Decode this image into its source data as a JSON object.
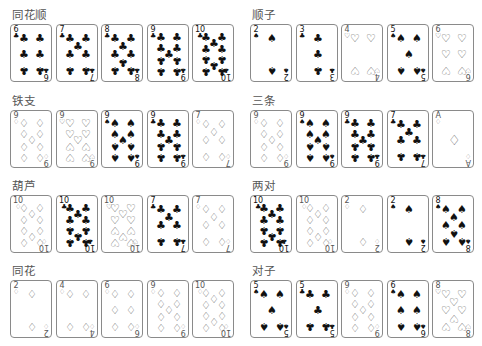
{
  "suit_glyphs": {
    "C": "♣",
    "S": "♠",
    "H": "♡",
    "D": "♢"
  },
  "colors": {
    "border": "#8a8a8a",
    "title": "#555555",
    "black_suit": "#111111",
    "outline_suit": "#555555"
  },
  "groups": [
    {
      "title": "同花顺",
      "cards": [
        {
          "rank": "6",
          "suit": "C"
        },
        {
          "rank": "7",
          "suit": "C"
        },
        {
          "rank": "8",
          "suit": "C"
        },
        {
          "rank": "9",
          "suit": "C"
        },
        {
          "rank": "10",
          "suit": "C"
        }
      ]
    },
    {
      "title": "顺子",
      "cards": [
        {
          "rank": "2",
          "suit": "S"
        },
        {
          "rank": "3",
          "suit": "C"
        },
        {
          "rank": "4",
          "suit": "H"
        },
        {
          "rank": "5",
          "suit": "S"
        },
        {
          "rank": "6",
          "suit": "H"
        }
      ]
    },
    {
      "title": "铁支",
      "cards": [
        {
          "rank": "9",
          "suit": "D"
        },
        {
          "rank": "9",
          "suit": "H"
        },
        {
          "rank": "9",
          "suit": "S"
        },
        {
          "rank": "9",
          "suit": "C"
        },
        {
          "rank": "7",
          "suit": "D"
        }
      ]
    },
    {
      "title": "三条",
      "cards": [
        {
          "rank": "9",
          "suit": "D"
        },
        {
          "rank": "9",
          "suit": "S"
        },
        {
          "rank": "9",
          "suit": "C"
        },
        {
          "rank": "7",
          "suit": "C"
        },
        {
          "rank": "A",
          "suit": "D"
        }
      ]
    },
    {
      "title": "葫芦",
      "cards": [
        {
          "rank": "10",
          "suit": "D"
        },
        {
          "rank": "10",
          "suit": "C"
        },
        {
          "rank": "10",
          "suit": "H"
        },
        {
          "rank": "7",
          "suit": "C"
        },
        {
          "rank": "7",
          "suit": "D"
        }
      ]
    },
    {
      "title": "两对",
      "cards": [
        {
          "rank": "10",
          "suit": "C"
        },
        {
          "rank": "10",
          "suit": "D"
        },
        {
          "rank": "2",
          "suit": "D"
        },
        {
          "rank": "2",
          "suit": "S"
        },
        {
          "rank": "8",
          "suit": "S"
        }
      ]
    },
    {
      "title": "同花",
      "cards": [
        {
          "rank": "2",
          "suit": "D"
        },
        {
          "rank": "4",
          "suit": "D"
        },
        {
          "rank": "6",
          "suit": "D"
        },
        {
          "rank": "9",
          "suit": "D"
        },
        {
          "rank": "10",
          "suit": "D"
        }
      ]
    },
    {
      "title": "对子",
      "cards": [
        {
          "rank": "5",
          "suit": "S"
        },
        {
          "rank": "5",
          "suit": "C"
        },
        {
          "rank": "9",
          "suit": "D"
        },
        {
          "rank": "6",
          "suit": "S"
        },
        {
          "rank": "8",
          "suit": "H"
        }
      ]
    }
  ]
}
